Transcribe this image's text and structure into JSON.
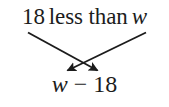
{
  "figure": {
    "type": "phrase-to-expression-translation",
    "background_color": "#ffffff",
    "ink_color": "#1c1c1c",
    "width": 169,
    "height": 107
  },
  "phrase": {
    "full_text": "18 less than w",
    "number": "18",
    "relation": "less than",
    "variable": "w",
    "variable_style": "italic"
  },
  "expression": {
    "full_text": "w − 18",
    "left_term": "w",
    "operator": "−",
    "right_term": "18",
    "variable_style": "italic"
  },
  "arrows": [
    {
      "name": "number-to-right-position",
      "from_label": "18",
      "to_label": "18",
      "direction": "down-right",
      "start": [
        28,
        33
      ],
      "end": [
        99,
        72
      ]
    },
    {
      "name": "variable-to-left-position",
      "from_label": "w",
      "to_label": "w",
      "direction": "down-left",
      "start": [
        146,
        33
      ],
      "end": [
        66,
        72
      ]
    }
  ]
}
